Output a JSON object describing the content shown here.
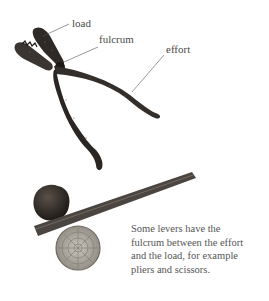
{
  "figure": {
    "labels": {
      "load": "load",
      "fulcrum": "fulcrum",
      "effort": "effort"
    },
    "illustrations": [
      "pliers",
      "lever-with-stone-on-log"
    ],
    "caption_lines": [
      "Some levers have the",
      "fulcrum between the effort",
      "and the load, for example",
      "pliers and scissors."
    ]
  }
}
